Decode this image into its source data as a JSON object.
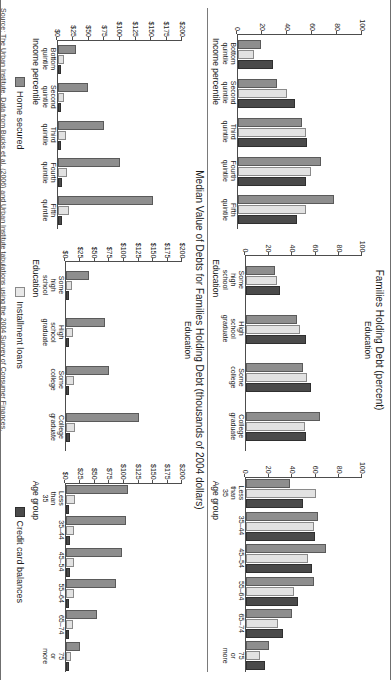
{
  "figure": {
    "rotation_degrees": 90,
    "source_note": "Source: The Urban Institute. Data from Bucks et al. (2006) and Urban Institute tabulations using the 2004 Survey of Consumer Finances."
  },
  "legend": {
    "items": [
      {
        "label": "Home secured",
        "color": "#8e8e8e",
        "key": "home_secured"
      },
      {
        "label": "Installment loans",
        "color": "#e8e8e8",
        "key": "installment_loans"
      },
      {
        "label": "Credit card balances",
        "color": "#4a4a4a",
        "key": "credit_card_balances"
      }
    ]
  },
  "chart_data": [
    {
      "type": "bar",
      "id": "holding-income",
      "title": "Families Holding Debt (percent)",
      "panel_label": "Income percentile",
      "xlabel": "Income percentile",
      "ylabel": "",
      "ylim": [
        0,
        100
      ],
      "yticks": [
        0,
        20,
        40,
        60,
        80,
        100
      ],
      "ytick_labels": [
        "0",
        "20",
        "40",
        "60",
        "80",
        "100"
      ],
      "grid": false,
      "categories": [
        "Bottom quintile",
        "Second quintile",
        "Third quintile",
        "Fourth quintile",
        "Fifth quintile"
      ],
      "series": [
        {
          "name": "Home secured",
          "values": [
            17,
            30,
            50,
            65,
            76
          ]
        },
        {
          "name": "Installment loans",
          "values": [
            11,
            38,
            53,
            57,
            53
          ]
        },
        {
          "name": "Credit card balances",
          "values": [
            27,
            44,
            54,
            53,
            46
          ]
        }
      ]
    },
    {
      "type": "bar",
      "id": "holding-education",
      "title": "Families Holding Debt (percent)",
      "panel_label": "Education",
      "xlabel": "Education",
      "ylabel": "",
      "ylim": [
        0,
        100
      ],
      "yticks": [
        0,
        20,
        40,
        60,
        80,
        100
      ],
      "ytick_labels": [
        "0",
        "20",
        "40",
        "60",
        "80",
        "100"
      ],
      "grid": false,
      "categories": [
        "Some high school",
        "High school graduate",
        "Some college",
        "College graduate"
      ],
      "series": [
        {
          "name": "Home secured",
          "values": [
            23,
            42,
            47,
            62
          ]
        },
        {
          "name": "Installment loans",
          "values": [
            25,
            45,
            51,
            49
          ]
        },
        {
          "name": "Credit card balances",
          "values": [
            28,
            50,
            54,
            50
          ]
        }
      ]
    },
    {
      "type": "bar",
      "id": "holding-age",
      "title": "Families Holding Debt (percent)",
      "panel_label": "Age group",
      "xlabel": "Age group",
      "ylabel": "",
      "ylim": [
        0,
        100
      ],
      "yticks": [
        0,
        20,
        40,
        60,
        80,
        100
      ],
      "ytick_labels": [
        "0",
        "20",
        "40",
        "60",
        "80",
        "100"
      ],
      "grid": false,
      "categories": [
        "Less than 35",
        "35-44",
        "45-54",
        "55-64",
        "65-74",
        "75 or more"
      ],
      "series": [
        {
          "name": "Home secured",
          "values": [
            36,
            60,
            67,
            57,
            38,
            18
          ]
        },
        {
          "name": "Installment loans",
          "values": [
            59,
            57,
            52,
            40,
            26,
            10
          ]
        },
        {
          "name": "Credit card balances",
          "values": [
            47,
            58,
            55,
            43,
            30,
            15
          ]
        }
      ]
    },
    {
      "type": "bar",
      "id": "median-income",
      "title": "Median Value of Debts for Families Holding Debt (thousands of 2004 dollars)",
      "panel_label": "Income percentile",
      "xlabel": "Income percentile",
      "ylabel": "",
      "ylim": [
        0,
        200
      ],
      "yticks": [
        0,
        25,
        50,
        75,
        100,
        125,
        150,
        175,
        200
      ],
      "ytick_labels": [
        "$0",
        "$25",
        "$50",
        "$75",
        "$100",
        "$125",
        "$150",
        "$175",
        "$200"
      ],
      "grid": false,
      "categories": [
        "Bottom quintile",
        "Second quintile",
        "Third quintile",
        "Fourth quintile",
        "Fifth quintile"
      ],
      "series": [
        {
          "name": "Home secured",
          "values": [
            26,
            45,
            71,
            97,
            150
          ]
        },
        {
          "name": "Installment loans",
          "values": [
            6,
            7,
            10,
            12,
            14
          ]
        },
        {
          "name": "Credit card balances",
          "values": [
            1,
            1.5,
            2,
            2.5,
            4
          ]
        }
      ]
    },
    {
      "type": "bar",
      "id": "median-education",
      "title": "Median Value of Debts for Families Holding Debt (thousands of 2004 dollars)",
      "panel_label": "Education",
      "xlabel": "Education",
      "ylabel": "",
      "ylim": [
        0,
        200
      ],
      "yticks": [
        0,
        25,
        50,
        75,
        100,
        125,
        150,
        175,
        200
      ],
      "ytick_labels": [
        "$0",
        "$25",
        "$50",
        "$75",
        "$100",
        "$125",
        "$150",
        "$175",
        "$200"
      ],
      "grid": false,
      "categories": [
        "Some high school",
        "High school graduate",
        "Some college",
        "College graduate"
      ],
      "series": [
        {
          "name": "Home secured",
          "values": [
            37,
            63,
            70,
            122
          ]
        },
        {
          "name": "Installment loans",
          "values": [
            7,
            9,
            10,
            12
          ]
        },
        {
          "name": "Credit card balances",
          "values": [
            1.5,
            2,
            2,
            3
          ]
        }
      ]
    },
    {
      "type": "bar",
      "id": "median-age",
      "title": "Median Value of Debts for Families Holding Debt (thousands of 2004 dollars)",
      "panel_label": "Age group",
      "xlabel": "Age group",
      "ylabel": "",
      "ylim": [
        0,
        200
      ],
      "yticks": [
        0,
        25,
        50,
        75,
        100,
        125,
        150,
        175,
        200
      ],
      "ytick_labels": [
        "$0",
        "$25",
        "$50",
        "$75",
        "$100",
        "$125",
        "$150",
        "$175",
        "$200"
      ],
      "grid": false,
      "categories": [
        "Less than 35",
        "35-44",
        "45-54",
        "55-64",
        "65-74",
        "75 or more"
      ],
      "series": [
        {
          "name": "Home secured",
          "values": [
            104,
            100,
            93,
            82,
            50,
            20
          ]
        },
        {
          "name": "Installment loans",
          "values": [
            12,
            11,
            11,
            10,
            8,
            5
          ]
        },
        {
          "name": "Credit card balances",
          "values": [
            2,
            3,
            3,
            2.5,
            2,
            1
          ]
        }
      ]
    }
  ]
}
